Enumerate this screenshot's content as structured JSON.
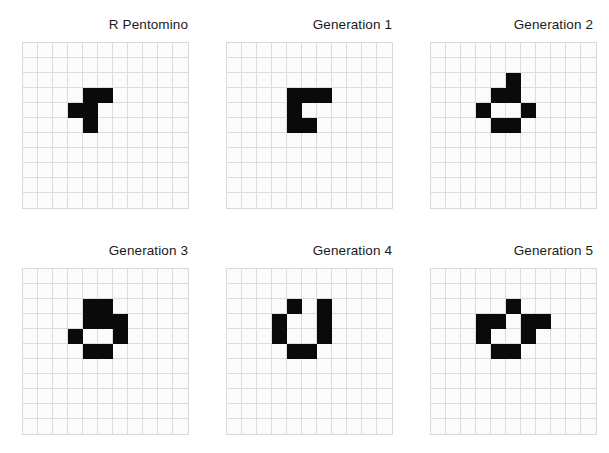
{
  "figure": {
    "grid_size": 11,
    "cell_color": "#0a0a0a",
    "grid_line_color": "#dcdcdc",
    "background_color": "#fbfbfb",
    "panel_rows": 2,
    "panel_cols": 3
  },
  "panels": [
    {
      "title": "R Pentomino",
      "generation": 0,
      "live_cells": [
        [
          3,
          4
        ],
        [
          3,
          5
        ],
        [
          4,
          3
        ],
        [
          4,
          4
        ],
        [
          5,
          4
        ]
      ],
      "live_count": 5
    },
    {
      "title": "Generation 1",
      "generation": 1,
      "live_cells": [
        [
          3,
          4
        ],
        [
          3,
          5
        ],
        [
          3,
          6
        ],
        [
          4,
          4
        ],
        [
          5,
          4
        ],
        [
          5,
          5
        ]
      ],
      "live_count": 6
    },
    {
      "title": "Generation 2",
      "generation": 2,
      "live_cells": [
        [
          2,
          5
        ],
        [
          3,
          4
        ],
        [
          3,
          5
        ],
        [
          4,
          3
        ],
        [
          4,
          6
        ],
        [
          5,
          4
        ],
        [
          5,
          5
        ]
      ],
      "live_count": 7
    },
    {
      "title": "Generation 3",
      "generation": 3,
      "live_cells": [
        [
          2,
          4
        ],
        [
          2,
          5
        ],
        [
          3,
          4
        ],
        [
          3,
          5
        ],
        [
          3,
          6
        ],
        [
          4,
          3
        ],
        [
          4,
          6
        ],
        [
          5,
          4
        ],
        [
          5,
          5
        ]
      ],
      "live_count": 9
    },
    {
      "title": "Generation 4",
      "generation": 4,
      "live_cells": [
        [
          2,
          4
        ],
        [
          2,
          6
        ],
        [
          3,
          3
        ],
        [
          3,
          6
        ],
        [
          4,
          3
        ],
        [
          4,
          6
        ],
        [
          5,
          4
        ],
        [
          5,
          5
        ]
      ],
      "live_count": 8
    },
    {
      "title": "Generation 5",
      "generation": 5,
      "live_cells": [
        [
          2,
          5
        ],
        [
          3,
          3
        ],
        [
          3,
          4
        ],
        [
          3,
          6
        ],
        [
          3,
          7
        ],
        [
          4,
          3
        ],
        [
          4,
          6
        ],
        [
          5,
          4
        ],
        [
          5,
          5
        ]
      ],
      "live_count": 9
    }
  ]
}
